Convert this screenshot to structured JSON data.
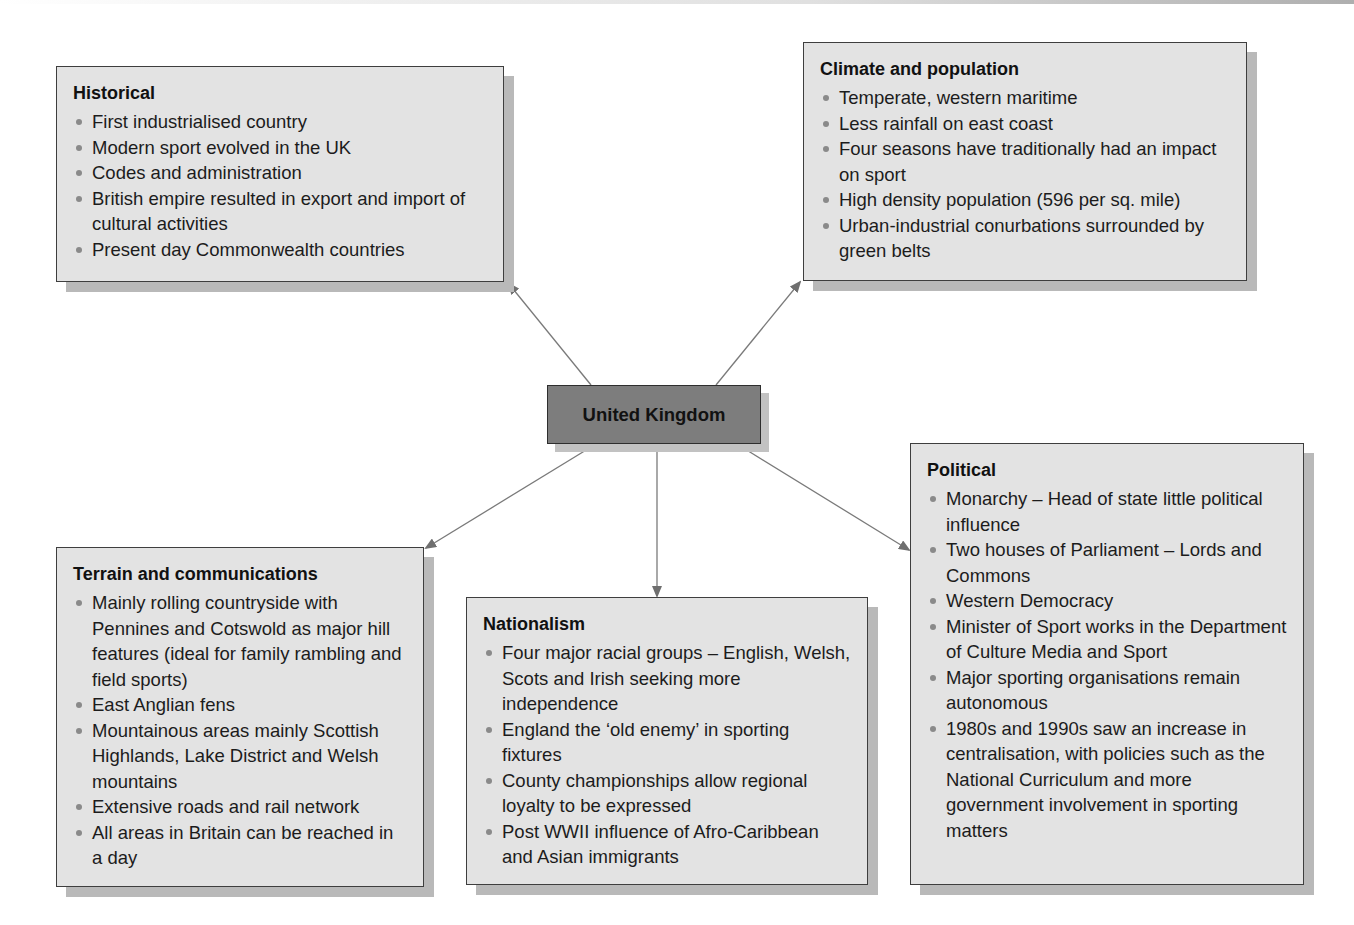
{
  "diagram": {
    "center": {
      "label": "United Kingdom"
    },
    "nodes": [
      {
        "id": "historical",
        "title": "Historical",
        "items": [
          "First industrialised country",
          "Modern sport evolved in the UK",
          "Codes and administration",
          "British empire resulted in export and import of cultural activities",
          "Present day Commonwealth countries"
        ]
      },
      {
        "id": "climate",
        "title": "Climate and population",
        "items": [
          "Temperate, western maritime",
          "Less rainfall on east coast",
          "Four seasons have traditionally had an impact on sport",
          "High density population (596 per sq. mile)",
          "Urban-industrial conurbations surrounded by green belts"
        ]
      },
      {
        "id": "terrain",
        "title": "Terrain and communications",
        "items": [
          "Mainly rolling countryside with Pennines and Cotswold as major hill features (ideal for family rambling and field sports)",
          "East Anglian fens",
          "Mountainous areas mainly Scottish Highlands, Lake District and Welsh mountains",
          "Extensive roads and rail network",
          "All areas in Britain can be reached in a day"
        ]
      },
      {
        "id": "nationalism",
        "title": "Nationalism",
        "items": [
          "Four major racial groups – English, Welsh, Scots and Irish seeking more independence",
          "England the ‘old enemy’ in sporting fixtures",
          "County championships allow regional loyalty to be expressed",
          "Post WWII influence of Afro-Caribbean and Asian immigrants"
        ]
      },
      {
        "id": "political",
        "title": "Political",
        "items": [
          "Monarchy – Head of state little political influence",
          "Two houses of Parliament – Lords and Commons",
          "Western Democracy",
          "Minister of Sport works in the Department of Culture Media and Sport",
          "Major sporting organisations remain autonomous",
          "1980s and 1990s saw an increase in centralisation, with policies such as the National Curriculum and more government involvement in sporting matters"
        ]
      }
    ],
    "colors": {
      "box_fill": "#e3e3e3",
      "box_border": "#3e3e3e",
      "box_shadow": "#b9b9b9",
      "center_fill": "#7d7d7d",
      "center_shadow": "#c2c2c2",
      "connector": "#7a7a7a",
      "bullet": "#8a8a8a"
    }
  }
}
